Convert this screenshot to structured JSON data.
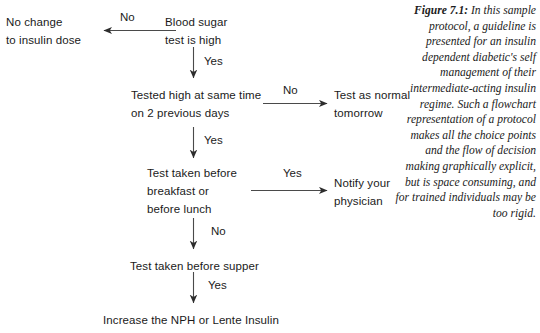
{
  "figure": {
    "caption_label": "Figure 7.1:",
    "caption_text": " In this sample protocol, a guideline is presented for an insulin dependent diabetic's self management of their intermediate-acting insulin regime. Such a flowchart representation of a protocol makes all the choice points and the flow of decision making graphically explicit, but is space consuming, and for trained individuals may be too rigid."
  },
  "flowchart": {
    "nodes": [
      {
        "id": "blood-sugar-test",
        "text": "Blood sugar\ntest is high"
      },
      {
        "id": "no-change-insulin-dose",
        "text": "No change\nto insulin dose"
      },
      {
        "id": "tested-high-same-time",
        "text": "Tested high at same time\non 2 previous days"
      },
      {
        "id": "test-as-normal-tomorrow",
        "text": "Test as normal\ntomorrow"
      },
      {
        "id": "test-taken-before-breakfast-lunch",
        "text": "Test taken before\nbreakfast or\nbefore lunch"
      },
      {
        "id": "notify-your-physician",
        "text": "Notify your\nphysician"
      },
      {
        "id": "test-taken-before-supper",
        "text": "Test taken before supper"
      },
      {
        "id": "increase-nph-lente-insulin",
        "text": "Increase the NPH or Lente Insulin"
      }
    ],
    "edges": [
      {
        "id": "edge-blood-sugar-no",
        "label": "No",
        "from": "blood-sugar-test",
        "to": "no-change-insulin-dose",
        "direction": "left"
      },
      {
        "id": "edge-blood-sugar-yes",
        "label": "Yes",
        "from": "blood-sugar-test",
        "to": "tested-high-same-time",
        "direction": "down"
      },
      {
        "id": "edge-tested-high-no",
        "label": "No",
        "from": "tested-high-same-time",
        "to": "test-as-normal-tomorrow",
        "direction": "right"
      },
      {
        "id": "edge-tested-high-yes",
        "label": "Yes",
        "from": "tested-high-same-time",
        "to": "test-taken-before-breakfast-lunch",
        "direction": "down"
      },
      {
        "id": "edge-before-breakfast-yes",
        "label": "Yes",
        "from": "test-taken-before-breakfast-lunch",
        "to": "notify-your-physician",
        "direction": "right"
      },
      {
        "id": "edge-before-breakfast-no",
        "label": "No",
        "from": "test-taken-before-breakfast-lunch",
        "to": "test-taken-before-supper",
        "direction": "down"
      },
      {
        "id": "edge-before-supper-yes",
        "label": "Yes",
        "from": "test-taken-before-supper",
        "to": "increase-nph-lente-insulin",
        "direction": "down"
      }
    ]
  },
  "colors": {
    "background": "#ffffff",
    "text": "#1a1a1a",
    "arrow": "#3a3a3a"
  }
}
